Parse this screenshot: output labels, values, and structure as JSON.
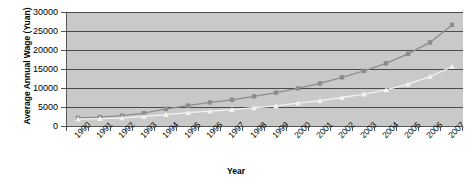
{
  "chart_data": {
    "type": "line",
    "title": "",
    "xlabel": "Year",
    "ylabel": "Average Annual Wage (Yuan)",
    "categories": [
      "1990",
      "1991",
      "1992",
      "1993",
      "1994",
      "1995",
      "1996",
      "1997",
      "1998",
      "1999",
      "2000",
      "2001",
      "2002",
      "2003",
      "2004",
      "2005",
      "2006",
      "2007"
    ],
    "ylim": [
      0,
      30000
    ],
    "yticks": [
      0,
      5000,
      10000,
      15000,
      20000,
      25000,
      30000
    ],
    "ytick_labels": [
      "0",
      "5000",
      "10000",
      "15000",
      "20000",
      "25000",
      "30000"
    ],
    "grid": true,
    "legend": "none",
    "series": [
      {
        "name": "series-squares",
        "marker": "square",
        "color": "#8c8c8c",
        "values": [
          2140,
          2340,
          2710,
          3370,
          4500,
          5350,
          6200,
          6900,
          7800,
          8800,
          9900,
          11200,
          12800,
          14500,
          16500,
          19000,
          22000,
          26600
        ]
      },
      {
        "name": "series-triangles",
        "marker": "triangle",
        "color": "#f2f2f2",
        "values": [
          1800,
          1950,
          2150,
          2500,
          3000,
          3500,
          3900,
          4300,
          4800,
          5300,
          6000,
          6700,
          7500,
          8400,
          9500,
          11000,
          13000,
          15600
        ]
      }
    ]
  },
  "axes": {
    "y_title": "Average Annual Wage (Yuan)",
    "x_title": "Year"
  }
}
